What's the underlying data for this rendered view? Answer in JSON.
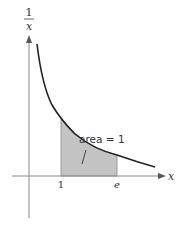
{
  "figure": {
    "y_axis_label": {
      "numerator": "1",
      "denominator": "x"
    },
    "x_axis_label": "x",
    "ticks": [
      {
        "label": "1",
        "value": 1
      },
      {
        "label": "e",
        "value": 2.718
      }
    ],
    "annotation": "area = 1",
    "curve": "y = 1/x",
    "shaded_region": {
      "from": "1",
      "to": "e"
    },
    "colors": {
      "curve": "#222222",
      "axes": "#888888",
      "shade": "#c4c4c4"
    }
  }
}
